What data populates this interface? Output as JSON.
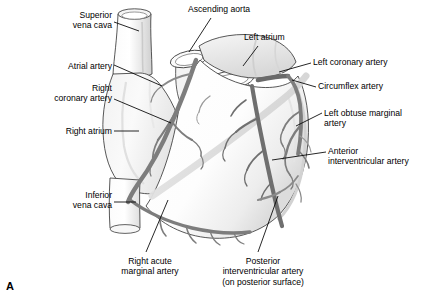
{
  "figure": {
    "panel_letter": "A",
    "view": "anterior surface of heart with coronary arteries",
    "ink_colors": {
      "outline": "#3a3a3a",
      "artery": "#7d7d7d",
      "artery_dark": "#6a6a6a",
      "shade_light": "#ededed",
      "shade_mid": "#dcdcdc",
      "leader": "#000000",
      "text": "#000000",
      "background": "#ffffff"
    },
    "labels": [
      {
        "id": "superior-vena-cava",
        "text": "Superior\nvena cava",
        "side": "left",
        "x": 36,
        "y": 10,
        "align": "right",
        "width": 76
      },
      {
        "id": "atrial-artery",
        "text": "Atrial artery",
        "side": "left",
        "x": 28,
        "y": 61,
        "align": "right",
        "width": 84
      },
      {
        "id": "right-coronary-artery",
        "text": "Right\ncoronary artery",
        "side": "left",
        "x": 10,
        "y": 83,
        "align": "right",
        "width": 102
      },
      {
        "id": "right-atrium",
        "text": "Right atrium",
        "side": "left",
        "x": 28,
        "y": 126,
        "align": "right",
        "width": 84
      },
      {
        "id": "inferior-vena-cava",
        "text": "Inferior\nvena cava",
        "side": "left",
        "x": 34,
        "y": 190,
        "align": "right",
        "width": 78
      },
      {
        "id": "ascending-aorta",
        "text": "Ascending aorta",
        "side": "top",
        "x": 188,
        "y": 4,
        "align": "left",
        "width": 96
      },
      {
        "id": "left-atrium",
        "text": "Left atrium",
        "side": "top",
        "x": 244,
        "y": 32,
        "align": "left",
        "width": 66
      },
      {
        "id": "left-coronary-artery",
        "text": "Left coronary artery",
        "side": "right",
        "x": 313,
        "y": 57,
        "align": "left",
        "width": 122
      },
      {
        "id": "circumflex-artery",
        "text": "Circumflex artery",
        "side": "right",
        "x": 318,
        "y": 81,
        "align": "left",
        "width": 108
      },
      {
        "id": "left-obtuse-marginal-artery",
        "text": "Left obtuse marginal\nartery",
        "side": "right",
        "x": 324,
        "y": 108,
        "align": "left",
        "width": 118
      },
      {
        "id": "anterior-interventricular-artery",
        "text": "Anterior\ninterventricular artery",
        "side": "right",
        "x": 328,
        "y": 146,
        "align": "left",
        "width": 114
      },
      {
        "id": "right-acute-marginal-artery",
        "text": "Right acute\nmarginal artery",
        "side": "bottom",
        "x": 104,
        "y": 256,
        "align": "center",
        "width": 92
      },
      {
        "id": "posterior-interventricular-artery",
        "text": "Posterior\ninterventricular artery\n(on posterior surface)",
        "side": "bottom",
        "x": 202,
        "y": 256,
        "align": "center",
        "width": 122
      }
    ]
  }
}
